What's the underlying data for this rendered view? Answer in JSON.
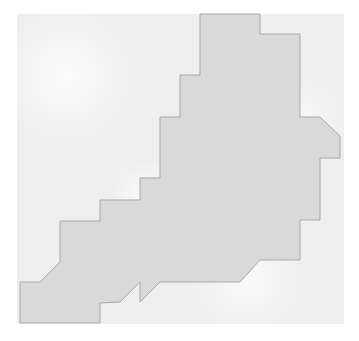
{
  "map": {
    "type": "region-outline",
    "background_color": "#efefef",
    "region": {
      "name": "region-shape",
      "fill": "#d9d9d9",
      "stroke": "#a8a8a8",
      "points": "200,14 260,14 260,34 300,34 300,117 320,117 340,136 340,158 320,158 320,220 300,220 300,260 260,260 240,282 160,282 140,302 140,282 120,302 100,303 100,323 20,323 20,282 40,282 60,262 60,221 100,221 100,200 140,200 140,178 160,178 160,117 180,117 180,75 200,75"
    }
  }
}
